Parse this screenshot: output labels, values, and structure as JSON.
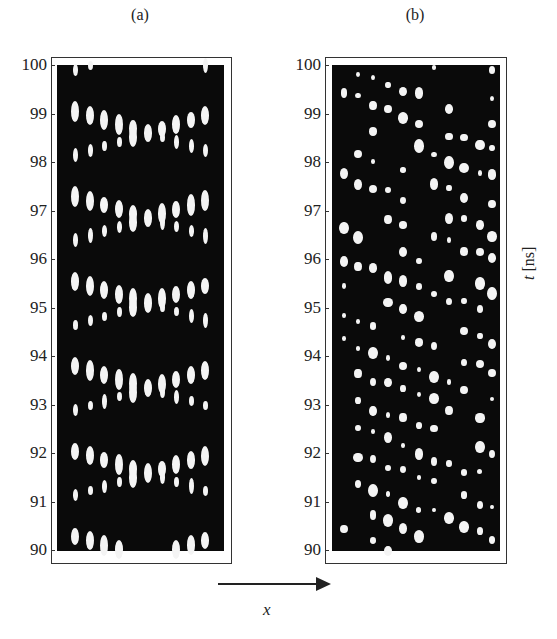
{
  "chart_data": [
    {
      "type": "heatmap",
      "title": "(a)",
      "xlabel": "x",
      "ylabel": "t [ns]",
      "ylim": [
        90,
        100
      ],
      "yticks": [
        90,
        91,
        92,
        93,
        94,
        95,
        96,
        97,
        98,
        99,
        100
      ],
      "description": "Zigzag pattern of bright elongated spots; diagonal stripes alternate direction with period ~1.75 ns",
      "pattern": "zigzag",
      "columns": 10,
      "period_ns": 1.75
    },
    {
      "type": "heatmap",
      "title": "(b)",
      "xlabel": "x",
      "ylabel": "t [ns]",
      "ylim": [
        90,
        100
      ],
      "yticks": [
        90,
        91,
        92,
        93,
        94,
        95,
        96,
        97,
        98,
        99,
        100
      ],
      "description": "Irregular lattice of round bright dots in ~10 columns with diagonal streak structure",
      "pattern": "irregular-dots",
      "columns": 10,
      "period_ns": 1.7
    }
  ],
  "panels": {
    "a": {
      "title": "(a)"
    },
    "b": {
      "title": "(b)"
    }
  },
  "axis": {
    "ylabel": "t [ns]",
    "xlabel": "x",
    "ticks": [
      "100",
      "99",
      "98",
      "97",
      "96",
      "95",
      "94",
      "93",
      "92",
      "91",
      "90"
    ]
  }
}
